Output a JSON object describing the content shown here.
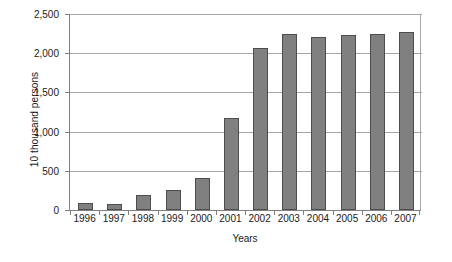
{
  "chart_data": {
    "type": "bar",
    "title": "",
    "subtitle": "",
    "xlabel": "Years",
    "ylabel": "10 thousand persons",
    "categories": [
      "1996",
      "1997",
      "1998",
      "1999",
      "2000",
      "2001",
      "2002",
      "2003",
      "2004",
      "2005",
      "2006",
      "2007"
    ],
    "values": [
      85,
      80,
      190,
      260,
      410,
      1175,
      2065,
      2250,
      2205,
      2230,
      2240,
      2275
    ],
    "series": [
      {
        "name": "Persons",
        "values": [
          85,
          80,
          190,
          260,
          410,
          1175,
          2065,
          2250,
          2205,
          2230,
          2240,
          2275
        ]
      }
    ],
    "ylim": [
      0,
      2500
    ],
    "y_ticks": [
      0,
      500,
      1000,
      1500,
      2000,
      2500
    ],
    "y_tick_labels": [
      "0",
      "500",
      "1,000",
      "1,500",
      "2,000",
      "2,500"
    ],
    "grid": true,
    "legend": false,
    "legend_position": "none",
    "bar_color": "#808080",
    "bar_border_color": "#4d4d4d",
    "gridline_color": "#a6a6a6",
    "axis_color": "#808080",
    "text_color": "#1a1a1a",
    "background": "#ffffff"
  }
}
